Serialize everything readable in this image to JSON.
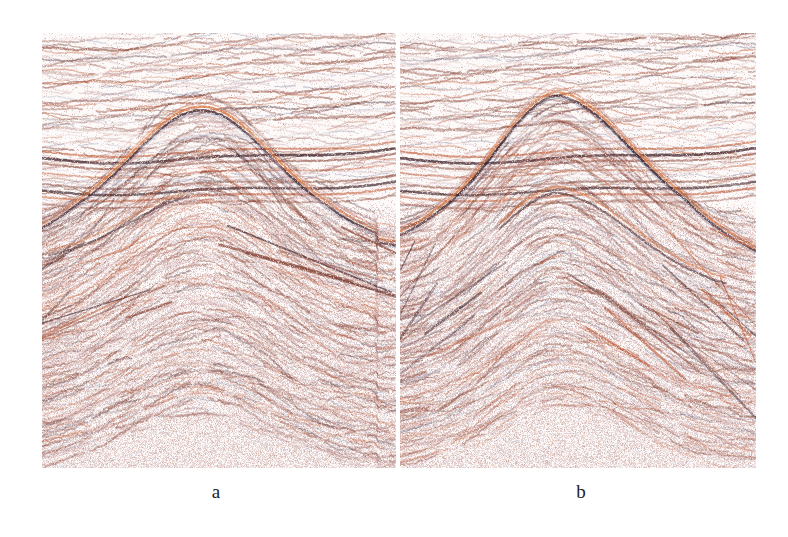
{
  "figure": {
    "background_color": "#ffffff",
    "panel_count": 2
  },
  "panels": [
    {
      "id": "a",
      "caption": "a",
      "x": 42,
      "y": 33,
      "width": 354,
      "height": 435,
      "description": "Seismic section with horizontally layered upper strata and a broad, smooth dome-shaped anticline in the lower half",
      "fold_style": "broad-dome",
      "fold_crest_x_fraction": 0.45,
      "fold_amplitude": 0.26,
      "fold_width": 0.62,
      "noise_seed": 1741,
      "chaos_level": 0.78
    },
    {
      "id": "b",
      "caption": "b",
      "x": 400,
      "y": 33,
      "width": 356,
      "height": 435,
      "description": "Seismic section with horizontally layered upper strata and a sharp, peaked anticline with steep flanks in the lower half",
      "fold_style": "peaked-anticline",
      "fold_crest_x_fraction": 0.44,
      "fold_amplitude": 0.32,
      "fold_width": 0.7,
      "noise_seed": 9032,
      "chaos_level": 0.62
    }
  ],
  "colors": {
    "background": "#ffffff",
    "panel_background": "#fdf9f8",
    "reflector_dark": "#3a2028",
    "reflector_brown": "#8b4a3a",
    "reflector_red": "#c0572e",
    "reflector_orange": "#d9743a",
    "reflector_blue": "#4a5a86",
    "reflector_pink": "#c9a0a2",
    "trough_light": "#f7eeec"
  },
  "chart_data": {
    "type": "heatmap",
    "subtitle": "",
    "xlabel": "",
    "ylabel": "",
    "legend_position": "none",
    "grid": false,
    "series": [
      {
        "name": "a",
        "caption": "a",
        "zones": [
          {
            "name": "upper-layered-strata",
            "y_range": [
              0.0,
              0.38
            ],
            "style": "continuous sub-horizontal reflectors",
            "reflector_count": 26,
            "dip": "gently undulating, slight rise to the right"
          },
          {
            "name": "strong-marker-reflector",
            "y_range": [
              0.26,
              0.32
            ],
            "style": "high-amplitude dark doublet",
            "reflector_count": 3,
            "dip": "broad low-amplitude syncline then rise"
          },
          {
            "name": "basal-unconformity",
            "y_range": [
              0.34,
              0.45
            ],
            "style": "bright orange-over-dark couplet draping the fold crest",
            "reflector_count": 2,
            "dip": "arched over dome"
          },
          {
            "name": "folded-core",
            "y_range": [
              0.4,
              1.0
            ],
            "style": "chaotic discontinuous wavy reflectors, broad dome",
            "reflector_count": 34,
            "dip": "dome with crest near x=0.45"
          }
        ]
      },
      {
        "name": "b",
        "caption": "b",
        "zones": [
          {
            "name": "upper-layered-strata",
            "y_range": [
              0.0,
              0.38
            ],
            "style": "continuous sub-horizontal reflectors",
            "reflector_count": 26,
            "dip": "gently undulating, slight rise to the right"
          },
          {
            "name": "strong-marker-reflector",
            "y_range": [
              0.26,
              0.32
            ],
            "style": "high-amplitude dark doublet",
            "reflector_count": 3,
            "dip": "broad low-amplitude syncline then rise"
          },
          {
            "name": "basal-unconformity",
            "y_range": [
              0.3,
              0.46
            ],
            "style": "bright orange-over-dark couplet, sharply peaked over crest with steep right flank",
            "reflector_count": 2,
            "dip": "sharp anticline, crest near x=0.44"
          },
          {
            "name": "folded-core",
            "y_range": [
              0.4,
              1.0
            ],
            "style": "more coherent, less chaotic; steeply dipping right flank reflectors",
            "reflector_count": 30,
            "dip": "peaked anticline with steep flanks"
          }
        ]
      }
    ]
  }
}
